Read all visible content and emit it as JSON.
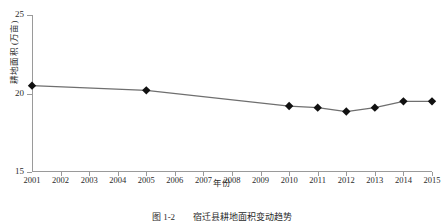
{
  "chart_data": {
    "type": "line",
    "title": "",
    "xlabel": "年份",
    "ylabel": "耕地面积 (万亩)",
    "caption": "图 1-2　　宿迁县耕地面积变动趋势",
    "categories": [
      "2001",
      "2002",
      "2003",
      "2004",
      "2005",
      "2006",
      "2007",
      "2008",
      "2009",
      "2010",
      "2011",
      "2012",
      "2013",
      "2014",
      "2015"
    ],
    "x": [
      2001,
      2002,
      2003,
      2004,
      2005,
      2006,
      2007,
      2008,
      2009,
      2010,
      2011,
      2012,
      2013,
      2014,
      2015
    ],
    "values": [
      20.5,
      null,
      null,
      null,
      20.2,
      null,
      null,
      null,
      null,
      19.2,
      19.1,
      18.85,
      19.1,
      19.5,
      19.5
    ],
    "marker_points": [
      {
        "year": "2001",
        "value": 20.5
      },
      {
        "year": "2005",
        "value": 20.2
      },
      {
        "year": "2010",
        "value": 19.2
      },
      {
        "year": "2011",
        "value": 19.1
      },
      {
        "year": "2012",
        "value": 18.85
      },
      {
        "year": "2013",
        "value": 19.1
      },
      {
        "year": "2014",
        "value": 19.5
      },
      {
        "year": "2015",
        "value": 19.5
      }
    ],
    "ylim": [
      15,
      25
    ],
    "xlim": [
      2001,
      2015
    ],
    "yticks": [
      15,
      20,
      25
    ],
    "ytick_labels": [
      "15",
      "20",
      "25"
    ],
    "grid": false,
    "legend": false,
    "series_color": "#6f6f6f",
    "marker_color": "#111111",
    "axis_color": "#9a9a9a"
  }
}
